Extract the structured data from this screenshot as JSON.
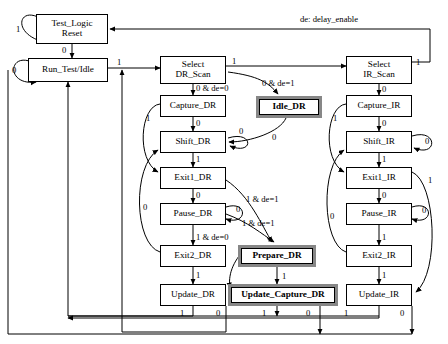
{
  "diagram": {
    "legend": {
      "text": "de: delay_enable"
    },
    "colors": {
      "background": "#ffffff",
      "stroke": "#000000",
      "highlight_border": "#878787",
      "text": "#000000"
    }
  },
  "states": [
    {
      "id": "test_logic_reset",
      "label_line1": "Test_Logic",
      "label_line2": "Reset",
      "highlight": false,
      "x": 36,
      "y": 14,
      "w": 72,
      "h": 30
    },
    {
      "id": "run_test_idle",
      "label_line1": "Run_Test/Idle",
      "label_line2": "",
      "highlight": false,
      "x": 28,
      "y": 58,
      "w": 80,
      "h": 24
    },
    {
      "id": "select_dr_scan",
      "label_line1": "Select",
      "label_line2": "DR_Scan",
      "highlight": false,
      "x": 160,
      "y": 56,
      "w": 66,
      "h": 28
    },
    {
      "id": "capture_dr",
      "label_line1": "Capture_DR",
      "label_line2": "",
      "highlight": false,
      "x": 160,
      "y": 95,
      "w": 66,
      "h": 22
    },
    {
      "id": "shift_dr",
      "label_line1": "Shift_DR",
      "label_line2": "",
      "highlight": false,
      "x": 160,
      "y": 131,
      "w": 66,
      "h": 22
    },
    {
      "id": "exit1_dr",
      "label_line1": "Exit1_DR",
      "label_line2": "",
      "highlight": false,
      "x": 160,
      "y": 167,
      "w": 66,
      "h": 22
    },
    {
      "id": "pause_dr",
      "label_line1": "Pause_DR",
      "label_line2": "",
      "highlight": false,
      "x": 160,
      "y": 203,
      "w": 66,
      "h": 22
    },
    {
      "id": "exit2_dr",
      "label_line1": "Exit2_DR",
      "label_line2": "",
      "highlight": false,
      "x": 160,
      "y": 245,
      "w": 66,
      "h": 22
    },
    {
      "id": "update_dr",
      "label_line1": "Update_DR",
      "label_line2": "",
      "highlight": false,
      "x": 160,
      "y": 284,
      "w": 66,
      "h": 22
    },
    {
      "id": "select_ir_scan",
      "label_line1": "Select",
      "label_line2": "IR_Scan",
      "highlight": false,
      "x": 346,
      "y": 56,
      "w": 66,
      "h": 28
    },
    {
      "id": "capture_ir",
      "label_line1": "Capture_IR",
      "label_line2": "",
      "highlight": false,
      "x": 346,
      "y": 95,
      "w": 66,
      "h": 22
    },
    {
      "id": "shift_ir",
      "label_line1": "Shift_IR",
      "label_line2": "",
      "highlight": false,
      "x": 346,
      "y": 131,
      "w": 66,
      "h": 22
    },
    {
      "id": "exit1_ir",
      "label_line1": "Exit1_IR",
      "label_line2": "",
      "highlight": false,
      "x": 346,
      "y": 167,
      "w": 66,
      "h": 22
    },
    {
      "id": "pause_ir",
      "label_line1": "Pause_IR",
      "label_line2": "",
      "highlight": false,
      "x": 346,
      "y": 203,
      "w": 66,
      "h": 22
    },
    {
      "id": "exit2_ir",
      "label_line1": "Exit2_IR",
      "label_line2": "",
      "highlight": false,
      "x": 346,
      "y": 245,
      "w": 66,
      "h": 22
    },
    {
      "id": "update_ir",
      "label_line1": "Update_IR",
      "label_line2": "",
      "highlight": false,
      "x": 346,
      "y": 284,
      "w": 66,
      "h": 22
    },
    {
      "id": "idle_dr",
      "label_line1": "Idle_DR",
      "label_line2": "",
      "highlight": true,
      "x": 256,
      "y": 96,
      "w": 66,
      "h": 22
    },
    {
      "id": "prepare_dr",
      "label_line1": "Prepare_DR",
      "label_line2": "",
      "highlight": true,
      "x": 238,
      "y": 245,
      "w": 78,
      "h": 22
    },
    {
      "id": "update_capture_dr",
      "label_line1": "Update_Capture_DR",
      "label_line2": "",
      "highlight": true,
      "x": 228,
      "y": 284,
      "w": 110,
      "h": 22
    }
  ],
  "transitions": [
    {
      "id": "tlr-self",
      "from": "test_logic_reset",
      "to": "test_logic_reset",
      "label": "1",
      "lx": 16,
      "ly": 25
    },
    {
      "id": "tlr-rti",
      "from": "test_logic_reset",
      "to": "run_test_idle",
      "label": "0",
      "lx": 62,
      "ly": 46
    },
    {
      "id": "rti-self",
      "from": "run_test_idle",
      "to": "run_test_idle",
      "label": "0",
      "lx": 12,
      "ly": 66
    },
    {
      "id": "rti-seldr",
      "from": "run_test_idle",
      "to": "select_dr_scan",
      "label": "1",
      "lx": 117,
      "ly": 58
    },
    {
      "id": "seldr-capdr",
      "from": "select_dr_scan",
      "to": "capture_dr",
      "label": "0 & de=0",
      "lx": 196,
      "ly": 84
    },
    {
      "id": "seldr-selir",
      "from": "select_dr_scan",
      "to": "select_ir_scan",
      "label": "1",
      "lx": 232,
      "ly": 57
    },
    {
      "id": "seldr-idledr",
      "from": "select_dr_scan",
      "to": "idle_dr",
      "label": "0 & de=1",
      "lx": 262,
      "ly": 79
    },
    {
      "id": "capdr-shiftdr",
      "from": "capture_dr",
      "to": "shift_dr",
      "label": "0",
      "lx": 196,
      "ly": 119
    },
    {
      "id": "capdr-exit1dr",
      "from": "capture_dr",
      "to": "exit1_dr",
      "label": "1",
      "lx": 146,
      "ly": 114
    },
    {
      "id": "shiftdr-self",
      "from": "shift_dr",
      "to": "shift_dr",
      "label": "0",
      "lx": 239,
      "ly": 127
    },
    {
      "id": "shiftdr-exit1dr",
      "from": "shift_dr",
      "to": "exit1_dr",
      "label": "1",
      "lx": 196,
      "ly": 155
    },
    {
      "id": "idledr-shiftdr",
      "from": "idle_dr",
      "to": "shift_dr",
      "label": "0",
      "lx": 272,
      "ly": 133
    },
    {
      "id": "exit1dr-pausedr",
      "from": "exit1_dr",
      "to": "pause_dr",
      "label": "0",
      "lx": 196,
      "ly": 191
    },
    {
      "id": "exit1dr-prepdr",
      "from": "exit1_dr",
      "to": "prepare_dr",
      "label": "1 & de=1",
      "lx": 246,
      "ly": 195
    },
    {
      "id": "pausedr-self",
      "from": "pause_dr",
      "to": "pause_dr",
      "label": "0",
      "lx": 236,
      "ly": 205
    },
    {
      "id": "pausedr-exit2dr",
      "from": "pause_dr",
      "to": "exit2_dr",
      "label": "1 & de=0",
      "lx": 196,
      "ly": 233
    },
    {
      "id": "pausedr-prepdr",
      "from": "pause_dr",
      "to": "prepare_dr",
      "label": "1 & de=1",
      "lx": 242,
      "ly": 219
    },
    {
      "id": "exit2dr-shiftdr",
      "from": "exit2_dr",
      "to": "shift_dr",
      "label": "0",
      "lx": 143,
      "ly": 203
    },
    {
      "id": "exit2dr-updr",
      "from": "exit2_dr",
      "to": "update_dr",
      "label": "1",
      "lx": 196,
      "ly": 271
    },
    {
      "id": "prepdr-ucdr",
      "from": "prepare_dr",
      "to": "update_capture_dr",
      "label": "1",
      "lx": 282,
      "ly": 272
    },
    {
      "id": "updr-rti",
      "from": "update_dr",
      "to": "run_test_idle",
      "label": "1",
      "lx": 180,
      "ly": 309
    },
    {
      "id": "updr-seldr",
      "from": "update_dr",
      "to": "select_dr_scan",
      "label": "0",
      "lx": 216,
      "ly": 309
    },
    {
      "id": "ucdr-rti",
      "from": "update_capture_dr",
      "to": "run_test_idle",
      "label": "1",
      "lx": 262,
      "ly": 309
    },
    {
      "id": "ucdr-seldr",
      "from": "update_capture_dr",
      "to": "select_dr_scan",
      "label": "0",
      "lx": 306,
      "ly": 309
    },
    {
      "id": "selir-tlr",
      "from": "select_ir_scan",
      "to": "test_logic_reset",
      "label": "1",
      "lx": 416,
      "ly": 58
    },
    {
      "id": "selir-capir",
      "from": "select_ir_scan",
      "to": "capture_ir",
      "label": "0",
      "lx": 382,
      "ly": 85
    },
    {
      "id": "capir-shiftir",
      "from": "capture_ir",
      "to": "shift_ir",
      "label": "0",
      "lx": 382,
      "ly": 119
    },
    {
      "id": "capir-exit1ir",
      "from": "capture_ir",
      "to": "exit1_ir",
      "label": "1",
      "lx": 333,
      "ly": 114
    },
    {
      "id": "shiftir-self",
      "from": "shift_ir",
      "to": "shift_ir",
      "label": "0",
      "lx": 425,
      "ly": 137
    },
    {
      "id": "shiftir-exit1ir",
      "from": "shift_ir",
      "to": "exit1_ir",
      "label": "1",
      "lx": 382,
      "ly": 155
    },
    {
      "id": "exit1ir-pauseir",
      "from": "exit1_ir",
      "to": "pause_ir",
      "label": "0",
      "lx": 382,
      "ly": 191
    },
    {
      "id": "exit1ir-upir",
      "from": "exit1_ir",
      "to": "update_ir",
      "label": "1",
      "lx": 428,
      "ly": 176
    },
    {
      "id": "pauseir-self",
      "from": "pause_ir",
      "to": "pause_ir",
      "label": "0",
      "lx": 422,
      "ly": 206
    },
    {
      "id": "pauseir-exit2ir",
      "from": "pause_ir",
      "to": "exit2_ir",
      "label": "1",
      "lx": 382,
      "ly": 233
    },
    {
      "id": "exit2ir-shiftir",
      "from": "exit2_ir",
      "to": "shift_ir",
      "label": "0",
      "lx": 330,
      "ly": 212
    },
    {
      "id": "exit2ir-upir",
      "from": "exit2_ir",
      "to": "update_ir",
      "label": "1",
      "lx": 382,
      "ly": 271
    },
    {
      "id": "upir-rti",
      "from": "update_ir",
      "to": "run_test_idle",
      "label": "1",
      "lx": 344,
      "ly": 309
    },
    {
      "id": "upir-seldr",
      "from": "update_ir",
      "to": "select_dr_scan",
      "label": "0",
      "lx": 400,
      "ly": 309
    }
  ]
}
